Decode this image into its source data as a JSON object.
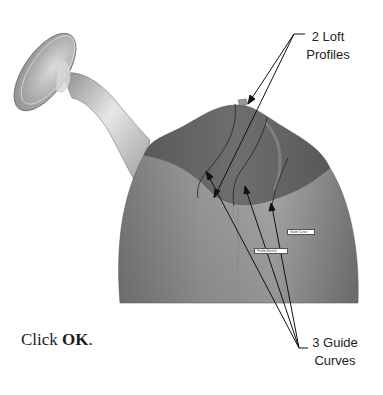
{
  "figure": {
    "colors": {
      "background": "#ffffff",
      "body_light": "#b5b5b5",
      "body_mid": "#8f8f8f",
      "body_dark": "#6a6a6a",
      "interior_dark": "#5e5e5e",
      "spout_light": "#e0e0e0",
      "spout_dark": "#8a8a8a",
      "leader_line": "#111111"
    },
    "callouts": {
      "loft_profiles": {
        "line1": "2 Loft",
        "line2": "Profiles"
      },
      "guide_curves": {
        "line1": "3 Guide",
        "line2": "Curves"
      }
    },
    "in_model_tags": {
      "guide_curve": "Guide Curve",
      "profile": "Profile(Sketch)"
    }
  },
  "instruction": {
    "prefix": "Click ",
    "bold": "OK",
    "suffix": "."
  }
}
